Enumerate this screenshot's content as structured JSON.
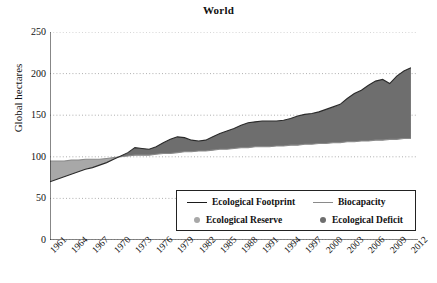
{
  "chart_data": {
    "type": "area",
    "title": "World",
    "xlabel": "",
    "ylabel": "Global hectares",
    "ylim": [
      0,
      250
    ],
    "yticks": [
      0,
      50,
      100,
      150,
      200,
      250
    ],
    "xlim": [
      1961,
      2013
    ],
    "xticks": [
      1961,
      1964,
      1967,
      1970,
      1973,
      1976,
      1979,
      1982,
      1985,
      1988,
      1991,
      1994,
      1997,
      2000,
      2003,
      2006,
      2009,
      2012
    ],
    "grid": "horizontal-dotted",
    "legend_position": "bottom-center",
    "legend": [
      {
        "label": "Ecological Footprint",
        "marker": "line",
        "color": "#1b1b1b"
      },
      {
        "label": "Biocapacity",
        "marker": "line",
        "color": "#8a8a8a"
      },
      {
        "label": "Ecological Reserve",
        "marker": "dot",
        "color": "#a8a8a8"
      },
      {
        "label": "Ecological Deficit",
        "marker": "dot",
        "color": "#6e6e6e"
      }
    ],
    "x": [
      1961,
      1962,
      1963,
      1964,
      1965,
      1966,
      1967,
      1968,
      1969,
      1970,
      1971,
      1972,
      1973,
      1974,
      1975,
      1976,
      1977,
      1978,
      1979,
      1980,
      1981,
      1982,
      1983,
      1984,
      1985,
      1986,
      1987,
      1988,
      1989,
      1990,
      1991,
      1992,
      1993,
      1994,
      1995,
      1996,
      1997,
      1998,
      1999,
      2000,
      2001,
      2002,
      2003,
      2004,
      2005,
      2006,
      2007,
      2008,
      2009,
      2010,
      2011,
      2012
    ],
    "series": [
      {
        "name": "Ecological Footprint",
        "color": "#1b1b1b",
        "values": [
          70,
          73,
          76,
          79,
          82,
          85,
          87,
          90,
          93,
          97,
          101,
          105,
          111,
          110,
          109,
          112,
          117,
          121,
          124,
          123,
          120,
          119,
          120,
          124,
          128,
          131,
          134,
          138,
          141,
          142,
          143,
          143,
          143,
          144,
          146,
          149,
          151,
          152,
          154,
          157,
          160,
          163,
          170,
          176,
          180,
          186,
          191,
          193,
          188,
          197,
          203,
          207
        ]
      },
      {
        "name": "Biocapacity",
        "color": "#8a8a8a",
        "values": [
          95,
          95,
          95,
          96,
          96,
          97,
          97,
          97,
          98,
          99,
          100,
          101,
          102,
          102,
          102,
          103,
          104,
          104,
          105,
          106,
          106,
          107,
          107,
          108,
          109,
          109,
          110,
          111,
          111,
          112,
          112,
          112,
          113,
          113,
          114,
          114,
          115,
          115,
          116,
          116,
          117,
          117,
          118,
          118,
          119,
          119,
          120,
          120,
          121,
          121,
          122,
          122
        ]
      }
    ],
    "fills": [
      {
        "name": "Ecological Reserve",
        "color": "#a8a8a8",
        "condition": "Biocapacity > Ecological Footprint",
        "range": [
          1961,
          1971
        ]
      },
      {
        "name": "Ecological Deficit",
        "color": "#6e6e6e",
        "condition": "Ecological Footprint > Biocapacity",
        "range": [
          1971,
          2012
        ]
      }
    ]
  }
}
